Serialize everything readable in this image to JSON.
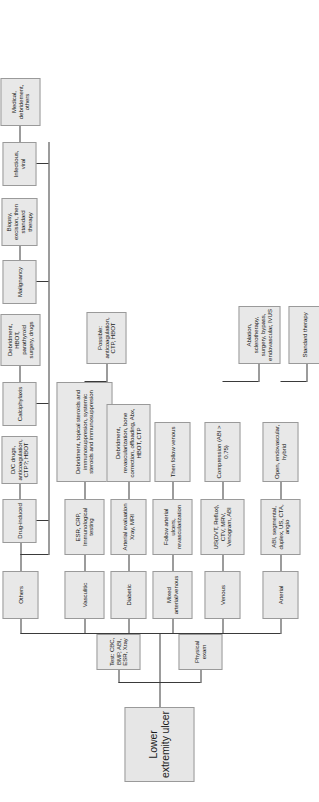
{
  "diagram": {
    "title": "Lower extremity ulcer",
    "type": "clinical-algorithm-flowchart",
    "orientation": "rotated-90-ccw",
    "colors": {
      "node_fill": "#e8e8e8",
      "node_border": "#9a9a9a",
      "connector": "#3a3a3a",
      "background": "#ffffff",
      "text": "#1a1a1a"
    },
    "root": {
      "label": "Lower extremity ulcer"
    },
    "initial_workup": [
      {
        "id": "workup_tests",
        "label": "Test: CBC, BMP, ABI, ESR, Xray"
      },
      {
        "id": "workup_exam",
        "label": "Physical exam"
      }
    ],
    "categories": [
      {
        "id": "arterial",
        "label": "Arterial",
        "evaluation": "ABI, segmental, duplex, US, CTA, angio",
        "treatments": [
          "Open, endovascular, hybrid",
          "Standard therapy"
        ]
      },
      {
        "id": "venous",
        "label": "Venous",
        "evaluation": "US(DVT, Reflux), CTV, MRV, Venogram, ABI",
        "treatments": [
          "Compression (ABI > 0.75)",
          "Ablation, sclerotherapy, surgery, bypass, endovascular, IVUS"
        ]
      },
      {
        "id": "mixed",
        "label": "Mixed arterial/venous",
        "evaluation": "Follow arterial ulcers, revascularization",
        "treatments": [
          "Then follow venous"
        ]
      },
      {
        "id": "diabetic",
        "label": "Diabetic",
        "evaluation": "Arterial evaluation Xray, MRI",
        "treatments": [
          "Debridment, revascularization, bone correction, offloading, Abx, HBOT, CTP"
        ]
      },
      {
        "id": "vasculitic",
        "label": "Vasculitic",
        "evaluation": "ESR, CRP, Immunological testing",
        "treatments": [
          "Debridment, topical steroids and immunosuppresion, systemic steroids and immunosuppresion",
          "Possible: anticoagulation, CTP, HBOT"
        ]
      }
    ],
    "others": {
      "label": "Others",
      "subtypes": [
        {
          "id": "drug_induced",
          "label": "Drug-induced",
          "treatment": "D/C drugs, anticoagulation, CTP?; HBOT"
        },
        {
          "id": "calciphylaxis",
          "label": "Calciphylaxis",
          "treatment": "Debridment, HBOT, parathyroid surgery, drugs"
        },
        {
          "id": "malignancy",
          "label": "Malignancy",
          "treatment": "Biopsy, excision, then standard therapy"
        },
        {
          "id": "infectious",
          "label": "Infectious, viral",
          "treatment": "Medical, debridement, others"
        }
      ]
    }
  }
}
